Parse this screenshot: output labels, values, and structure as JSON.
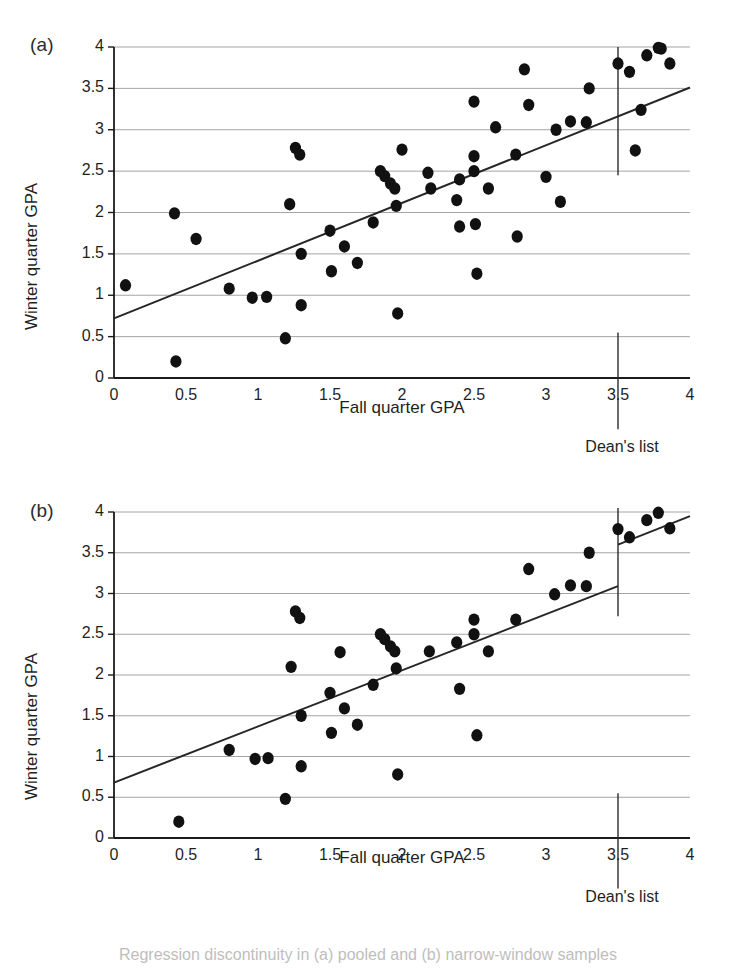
{
  "figure": {
    "caption_partial": "Regression discontinuity in (a) pooled and (b) narrow-window samples"
  },
  "chart_data": [
    {
      "panel": "a",
      "panel_label": "(a)",
      "type": "scatter",
      "title": "",
      "xlabel": "Fall quarter GPA",
      "ylabel": "Winter quarter GPA",
      "xlim": [
        0,
        4
      ],
      "ylim": [
        0,
        4
      ],
      "xticks": [
        0,
        0.5,
        1,
        1.5,
        2,
        2.5,
        3,
        3.5,
        4
      ],
      "xticklabels": [
        "0",
        "0.5",
        "1",
        "1.5",
        "2",
        "2.5",
        "3",
        "3.5",
        "4"
      ],
      "yticks": [
        0,
        0.5,
        1,
        1.5,
        2,
        2.5,
        3,
        3.5,
        4
      ],
      "yticklabels": [
        "0",
        "0.5",
        "1",
        "1.5",
        "2",
        "2.5",
        "3",
        "3.5",
        "4"
      ],
      "grid": "horizontal",
      "legend": "none",
      "marker_color": "#111111",
      "line_color": "#262626",
      "cutoff": {
        "x": 3.5,
        "label": "Dean's list",
        "line_top": 4.0,
        "line_bottom": 2.45,
        "stub_top": 0.55,
        "stub_bottom": -0.62
      },
      "fit": {
        "continuous": true,
        "segments": [
          {
            "x0": 0.0,
            "y0": 0.72,
            "x1": 4.0,
            "y1": 3.51
          }
        ]
      },
      "points": [
        [
          0.08,
          1.12
        ],
        [
          0.42,
          1.99
        ],
        [
          0.43,
          0.2
        ],
        [
          0.57,
          1.68
        ],
        [
          0.8,
          1.08
        ],
        [
          0.96,
          0.97
        ],
        [
          1.06,
          0.98
        ],
        [
          1.19,
          0.48
        ],
        [
          1.22,
          2.1
        ],
        [
          1.26,
          2.78
        ],
        [
          1.29,
          2.7
        ],
        [
          1.3,
          1.5
        ],
        [
          1.3,
          0.88
        ],
        [
          1.5,
          1.78
        ],
        [
          1.51,
          1.29
        ],
        [
          1.6,
          1.59
        ],
        [
          1.69,
          1.39
        ],
        [
          1.8,
          1.88
        ],
        [
          1.85,
          2.5
        ],
        [
          1.88,
          2.44
        ],
        [
          1.92,
          2.35
        ],
        [
          1.95,
          2.29
        ],
        [
          1.96,
          2.08
        ],
        [
          1.97,
          0.78
        ],
        [
          2.0,
          2.76
        ],
        [
          2.18,
          2.48
        ],
        [
          2.2,
          2.29
        ],
        [
          2.38,
          2.15
        ],
        [
          2.4,
          2.4
        ],
        [
          2.4,
          1.83
        ],
        [
          2.5,
          2.5
        ],
        [
          2.5,
          2.68
        ],
        [
          2.5,
          3.34
        ],
        [
          2.51,
          1.86
        ],
        [
          2.52,
          1.26
        ],
        [
          2.6,
          2.29
        ],
        [
          2.65,
          3.03
        ],
        [
          2.79,
          2.7
        ],
        [
          2.8,
          1.71
        ],
        [
          2.85,
          3.73
        ],
        [
          2.88,
          3.3
        ],
        [
          3.0,
          2.43
        ],
        [
          3.07,
          3.0
        ],
        [
          3.1,
          2.13
        ],
        [
          3.17,
          3.1
        ],
        [
          3.28,
          3.09
        ],
        [
          3.3,
          3.5
        ],
        [
          3.5,
          3.8
        ],
        [
          3.58,
          3.7
        ],
        [
          3.62,
          2.75
        ],
        [
          3.66,
          3.24
        ],
        [
          3.7,
          3.9
        ],
        [
          3.78,
          3.99
        ],
        [
          3.8,
          3.98
        ],
        [
          3.86,
          3.8
        ]
      ]
    },
    {
      "panel": "b",
      "panel_label": "(b)",
      "type": "scatter",
      "title": "",
      "xlabel": "Fall quarter GPA",
      "ylabel": "Winter quarter GPA",
      "xlim": [
        0,
        4
      ],
      "ylim": [
        0,
        4
      ],
      "xticks": [
        0,
        0.5,
        1,
        1.5,
        2,
        2.5,
        3,
        3.5,
        4
      ],
      "xticklabels": [
        "0",
        "0.5",
        "1",
        "1.5",
        "2",
        "2.5",
        "3",
        "3.5",
        "4"
      ],
      "yticks": [
        0,
        0.5,
        1,
        1.5,
        2,
        2.5,
        3,
        3.5,
        4
      ],
      "yticklabels": [
        "0",
        "0.5",
        "1",
        "1.5",
        "2",
        "2.5",
        "3",
        "3.5",
        "4"
      ],
      "grid": "horizontal",
      "legend": "none",
      "marker_color": "#111111",
      "line_color": "#262626",
      "cutoff": {
        "x": 3.5,
        "label": "Dean's list",
        "line_top": 4.05,
        "line_bottom": 2.72,
        "stub_top": 0.55,
        "stub_bottom": -0.62
      },
      "fit": {
        "continuous": false,
        "segments": [
          {
            "x0": 0.0,
            "y0": 0.68,
            "x1": 3.5,
            "y1": 3.09
          },
          {
            "x0": 3.5,
            "y0": 3.6,
            "x1": 4.0,
            "y1": 3.95
          }
        ]
      },
      "points": [
        [
          0.45,
          0.2
        ],
        [
          0.8,
          1.08
        ],
        [
          0.98,
          0.97
        ],
        [
          1.07,
          0.98
        ],
        [
          1.19,
          0.48
        ],
        [
          1.23,
          2.1
        ],
        [
          1.26,
          2.78
        ],
        [
          1.29,
          2.7
        ],
        [
          1.3,
          1.5
        ],
        [
          1.3,
          0.88
        ],
        [
          1.5,
          1.78
        ],
        [
          1.51,
          1.29
        ],
        [
          1.57,
          2.28
        ],
        [
          1.6,
          1.59
        ],
        [
          1.69,
          1.39
        ],
        [
          1.8,
          1.88
        ],
        [
          1.85,
          2.5
        ],
        [
          1.88,
          2.44
        ],
        [
          1.92,
          2.35
        ],
        [
          1.95,
          2.29
        ],
        [
          1.96,
          2.08
        ],
        [
          1.97,
          0.78
        ],
        [
          2.19,
          2.29
        ],
        [
          2.38,
          2.4
        ],
        [
          2.4,
          1.83
        ],
        [
          2.5,
          2.5
        ],
        [
          2.5,
          2.68
        ],
        [
          2.52,
          1.26
        ],
        [
          2.6,
          2.29
        ],
        [
          2.79,
          2.68
        ],
        [
          2.88,
          3.3
        ],
        [
          3.06,
          2.99
        ],
        [
          3.17,
          3.1
        ],
        [
          3.28,
          3.09
        ],
        [
          3.3,
          3.5
        ],
        [
          3.5,
          3.79
        ],
        [
          3.58,
          3.69
        ],
        [
          3.7,
          3.9
        ],
        [
          3.78,
          3.99
        ],
        [
          3.86,
          3.8
        ]
      ]
    }
  ]
}
